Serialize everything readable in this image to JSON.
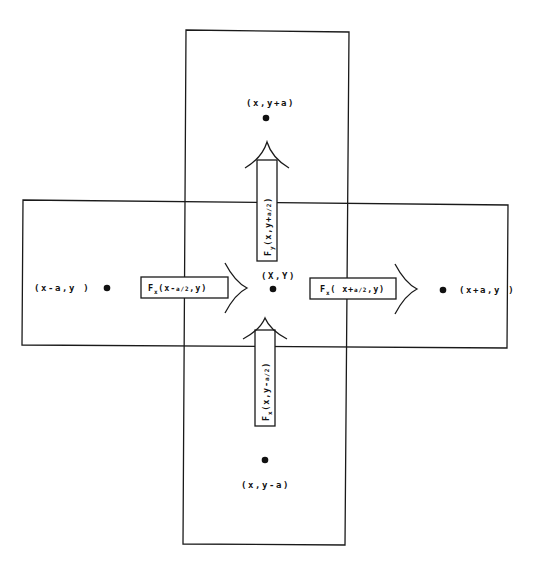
{
  "diagram": {
    "type": "finite-volume stencil (flux balance on a grid cell)",
    "line_color": "#1a1a1a",
    "background": "#ffffff",
    "nodes": {
      "center": "(X,Y)",
      "top": "(x,y+a)",
      "bottom": "(x,y-a)",
      "left": "(x-a,y )",
      "right": "(x+a,y )"
    },
    "fluxes": {
      "left": {
        "symbol": "F",
        "subscript": "x",
        "args": "(x-",
        "frac": "a/2",
        "tail": ",y)",
        "text": "Fx(x-a/2,y)"
      },
      "right": {
        "symbol": "F",
        "subscript": "x",
        "args": "( x+",
        "frac": "a/2",
        "tail": ",y)",
        "text": "Fx(x+a/2,y)"
      },
      "top": {
        "symbol": "F",
        "subscript": "y",
        "args": "(x,y+",
        "frac": "a/2",
        "tail": ")",
        "text": "Fy(x,y+a/2)"
      },
      "bottom": {
        "symbol": "F",
        "subscript": "x",
        "args": "(x,y-",
        "frac": "a/2",
        "tail": ")",
        "text": "Fx(x,y-a/2)"
      }
    }
  }
}
